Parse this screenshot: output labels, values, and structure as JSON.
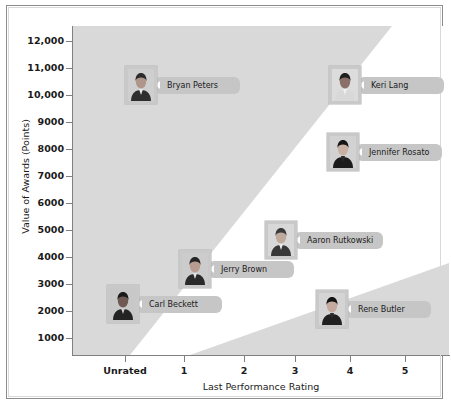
{
  "chart_data": {
    "type": "scatter",
    "title": "",
    "xlabel": "Last Performance Rating",
    "ylabel": "Value of Awards (Points)",
    "xtick_labels": [
      "Unrated",
      "1",
      "2",
      "3",
      "4",
      "5"
    ],
    "ytick_labels": [
      "1000",
      "2000",
      "3000",
      "4000",
      "5000",
      "6000",
      "7000",
      "8000",
      "9000",
      "10,000",
      "11,000",
      "12,000"
    ],
    "ylim": [
      0,
      12600
    ],
    "xlim": [
      -0.6,
      5.6
    ],
    "grid": false,
    "legend": "none",
    "marker_style": "employee-photo-with-name-callout",
    "points": [
      {
        "name": "Bryan Peters",
        "x": "Unrated",
        "x_value": 0.55,
        "y": 10800,
        "photo": "male-dark-suit"
      },
      {
        "name": "Keri Lang",
        "x": "4",
        "x_value": 3.85,
        "y": 10750,
        "photo": "female-short-hair"
      },
      {
        "name": "Jennifer Rosato",
        "x": "4",
        "x_value": 3.8,
        "y": 8000,
        "photo": "female-long-hair"
      },
      {
        "name": "Aaron Rutkowski",
        "x": "3",
        "x_value": 2.95,
        "y": 4600,
        "photo": "male-light-suit"
      },
      {
        "name": "Jerry Brown",
        "x": "2",
        "x_value": 1.85,
        "y": 3500,
        "photo": "male-glasses"
      },
      {
        "name": "Carl Beckett",
        "x": "Unrated",
        "x_value": 0.2,
        "y": 2050,
        "photo": "male-short-hair"
      },
      {
        "name": "Rene Butler",
        "x": "4",
        "x_value": 3.7,
        "y": 1650,
        "photo": "female-dark-hair"
      }
    ],
    "bands": [
      {
        "name": "upper-left-region",
        "fill": "#d9d9d9"
      },
      {
        "name": "lower-right-region",
        "fill": "#d9d9d9"
      }
    ]
  },
  "colors": {
    "band_gray": "#d9d9d9",
    "plot_background": "#ffffff",
    "axis": "#808080",
    "frame": "#8c8c8c",
    "callout_gray": "#c6c6c6",
    "photo_frame": "#c9c9c9",
    "text": "#1a1a1a"
  },
  "axes": {
    "y_ticks_px": [
      {
        "label": "12,000",
        "top": 35
      },
      {
        "label": "11,000",
        "top": 62
      },
      {
        "label": "10,000",
        "top": 89
      },
      {
        "label": "9000",
        "top": 116
      },
      {
        "label": "8000",
        "top": 143
      },
      {
        "label": "7000",
        "top": 170
      },
      {
        "label": "6000",
        "top": 197
      },
      {
        "label": "5000",
        "top": 224
      },
      {
        "label": "4000",
        "top": 251
      },
      {
        "label": "3000",
        "top": 278
      },
      {
        "label": "2000",
        "top": 305
      },
      {
        "label": "1000",
        "top": 332
      }
    ],
    "x_ticks_px": [
      {
        "label": "Unrated",
        "left": 118
      },
      {
        "label": "1",
        "left": 177
      },
      {
        "label": "2",
        "left": 237
      },
      {
        "label": "3",
        "left": 288
      },
      {
        "label": "4",
        "left": 343
      },
      {
        "label": "5",
        "left": 398
      }
    ]
  },
  "markers": [
    {
      "name": "Bryan Peters",
      "left": 118,
      "top": 59,
      "photo": "male-dark-suit"
    },
    {
      "name": "Keri Lang",
      "left": 322,
      "top": 59,
      "photo": "female-short-hair"
    },
    {
      "name": "Jennifer Rosato",
      "left": 320,
      "top": 126,
      "photo": "female-long-hair"
    },
    {
      "name": "Aaron Rutkowski",
      "left": 258,
      "top": 214,
      "photo": "male-light-suit"
    },
    {
      "name": "Jerry Brown",
      "left": 172,
      "top": 243,
      "photo": "male-glasses"
    },
    {
      "name": "Carl Beckett",
      "left": 100,
      "top": 278,
      "photo": "male-short-hair"
    },
    {
      "name": "Rene Butler",
      "left": 309,
      "top": 283,
      "photo": "female-dark-hair"
    }
  ]
}
